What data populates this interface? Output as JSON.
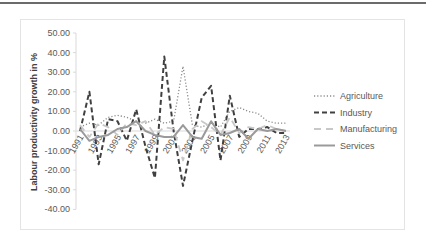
{
  "chart_data": {
    "type": "line",
    "title": "",
    "xlabel": "",
    "ylabel": "Labour productivity growth in %",
    "ylim": [
      -40,
      50
    ],
    "yticks": [
      "50.00",
      "40.00",
      "30.00",
      "20.00",
      "10.00",
      "0.00",
      "-10.00",
      "-20.00",
      "-30.00",
      "-40.00"
    ],
    "xtick_labels": [
      "1991",
      "1993",
      "1995",
      "1997",
      "1999",
      "2001",
      "2003",
      "2005",
      "2007",
      "2009",
      "2011",
      "2013"
    ],
    "x": [
      1991,
      1992,
      1993,
      1994,
      1995,
      1996,
      1997,
      1998,
      1999,
      2000,
      2001,
      2002,
      2003,
      2004,
      2005,
      2006,
      2007,
      2008,
      2009,
      2010,
      2011,
      2012,
      2013
    ],
    "grid": false,
    "legend_position": "right",
    "series": [
      {
        "name": "Agriculture",
        "style": "dotted",
        "color": "#8c8c8c",
        "values": [
          2,
          4,
          3,
          7,
          8,
          7,
          5,
          4,
          6,
          4,
          5,
          33,
          3,
          2,
          4,
          2,
          10,
          12,
          10,
          9,
          5,
          4,
          4
        ]
      },
      {
        "name": "Industry",
        "style": "dashed",
        "color": "#404040",
        "values": [
          0,
          20,
          -17,
          6,
          5,
          -5,
          11,
          -8,
          -24,
          38,
          0,
          -28,
          -5,
          17,
          23,
          -15,
          18,
          -3,
          1,
          1,
          2,
          -1,
          -1
        ]
      },
      {
        "name": "Manufacturing",
        "style": "long-dash",
        "color": "#c8c8c8",
        "values": [
          3,
          -3,
          4,
          2,
          -2,
          4,
          3,
          5,
          -2,
          2,
          1,
          -15,
          1,
          5,
          2,
          -2,
          7,
          -1,
          2,
          1,
          3,
          1,
          0
        ]
      },
      {
        "name": "Services",
        "style": "solid",
        "color": "#9a9a9a",
        "values": [
          1,
          -5,
          -3,
          -2,
          1,
          2,
          5,
          0,
          -2,
          -3,
          -3,
          3,
          -3,
          -4,
          5,
          -2,
          -1,
          1,
          -4,
          1,
          0,
          1,
          0
        ]
      }
    ]
  },
  "legend": {
    "items": [
      "Agriculture",
      "Industry",
      "Manufacturing",
      "Services"
    ]
  },
  "axis": {
    "ylabel": "Labour productivity growth in %"
  }
}
